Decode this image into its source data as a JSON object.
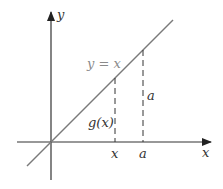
{
  "diagram": {
    "axes": {
      "x_label": "x",
      "y_label": "y"
    },
    "line_label": "y = x",
    "ticks": [
      {
        "id": "x",
        "label": "x"
      },
      {
        "id": "a",
        "label": "a"
      }
    ],
    "segment_labels": {
      "at_x": "g(x)",
      "at_a": "a"
    },
    "colors": {
      "axes": "#333333",
      "line": "#7a7a7a",
      "dashed": "#333333",
      "line_label": "#8a8a8a"
    }
  }
}
